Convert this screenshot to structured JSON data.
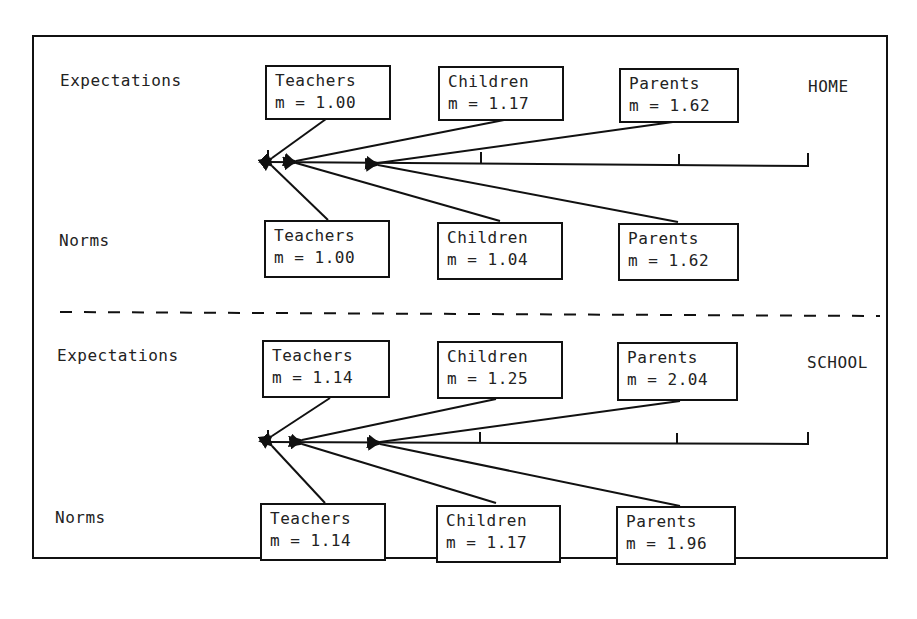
{
  "sections": [
    {
      "context": "HOME",
      "expectations_label": "Expectations",
      "norms_label": "Norms",
      "expectations": [
        {
          "group": "Teachers",
          "mean": "m = 1.00"
        },
        {
          "group": "Children",
          "mean": "m = 1.17"
        },
        {
          "group": "Parents",
          "mean": "m = 1.62"
        }
      ],
      "norms": [
        {
          "group": "Teachers",
          "mean": "m = 1.00"
        },
        {
          "group": "Children",
          "mean": "m = 1.04"
        },
        {
          "group": "Parents",
          "mean": "m = 1.62"
        }
      ]
    },
    {
      "context": "SCHOOL",
      "expectations_label": "Expectations",
      "norms_label": "Norms",
      "expectations": [
        {
          "group": "Teachers",
          "mean": "m = 1.14"
        },
        {
          "group": "Children",
          "mean": "m = 1.25"
        },
        {
          "group": "Parents",
          "mean": "m = 2.04"
        }
      ],
      "norms": [
        {
          "group": "Teachers",
          "mean": "m = 1.14"
        },
        {
          "group": "Children",
          "mean": "m = 1.17"
        },
        {
          "group": "Parents",
          "mean": "m = 1.96"
        }
      ]
    }
  ],
  "colors": {
    "ink": "#111111",
    "background": "#ffffff"
  }
}
